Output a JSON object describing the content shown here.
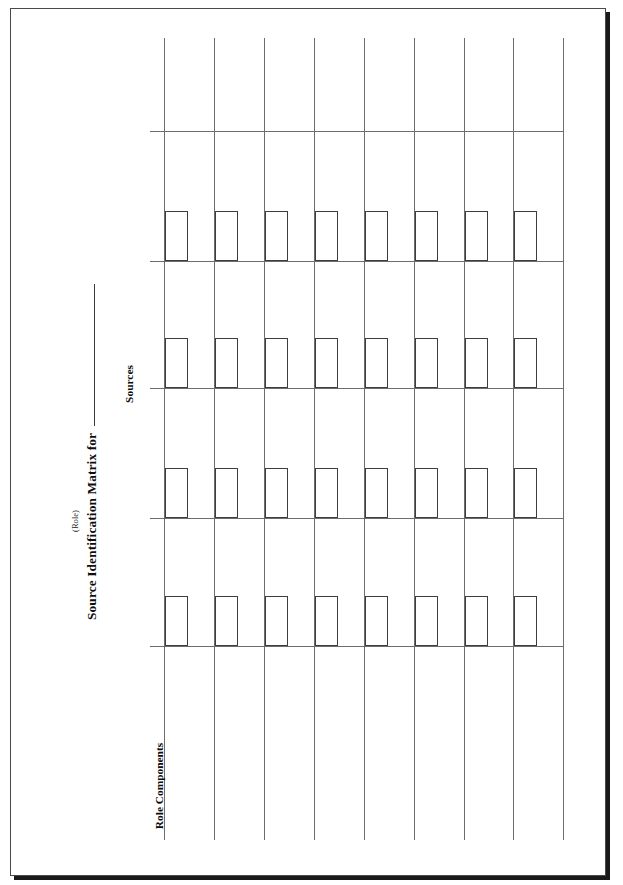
{
  "document": {
    "title": "Source Identification Matrix for",
    "role_caption": "(Role)",
    "axis_rows_label": "Sources",
    "axis_columns_label": "Role Components",
    "blank_fill_line": "",
    "ink_color": "#0d0d0d",
    "rule_color": "#6d6d6d",
    "box_color": "#3d3d3d",
    "page_border_color": "#4a4a4a",
    "page_shadow_color": "#1a1a1a",
    "paper_color": "#ffffff"
  },
  "chart_data": {
    "type": "table",
    "title": "Source Identification Matrix for",
    "xlabel": "Role Components",
    "ylabel": "Sources",
    "orientation": "landscape-rotated-90ccw",
    "grid": true,
    "columns": 8,
    "rows": 4,
    "column_headers": [
      "",
      "",
      "",
      "",
      "",
      "",
      "",
      ""
    ],
    "row_headers": [
      "",
      "",
      "",
      ""
    ],
    "cells": [
      [
        "",
        "",
        "",
        "",
        "",
        "",
        "",
        ""
      ],
      [
        "",
        "",
        "",
        "",
        "",
        "",
        "",
        ""
      ],
      [
        "",
        "",
        "",
        "",
        "",
        "",
        "",
        ""
      ],
      [
        "",
        "",
        "",
        "",
        "",
        "",
        "",
        ""
      ]
    ],
    "checkbox_per_cell": true,
    "note": "Blank worksheet form: 8 component columns by 4 source rows, each cell holding an empty check box."
  },
  "geometry": {
    "vertical_line_x": [
      164,
      214,
      264,
      314,
      364,
      414,
      464,
      513,
      563
    ],
    "vertical_line_top": 38,
    "vertical_line_bottom": 840,
    "horizontal_line_y": [
      131,
      261,
      388,
      518,
      646
    ],
    "horizontal_line_left": 150,
    "horizontal_line_right": 563,
    "box_width": 23,
    "box_height": 50,
    "box_offset_x": 1,
    "box_row_baselines": [
      261,
      388,
      518,
      646
    ]
  }
}
